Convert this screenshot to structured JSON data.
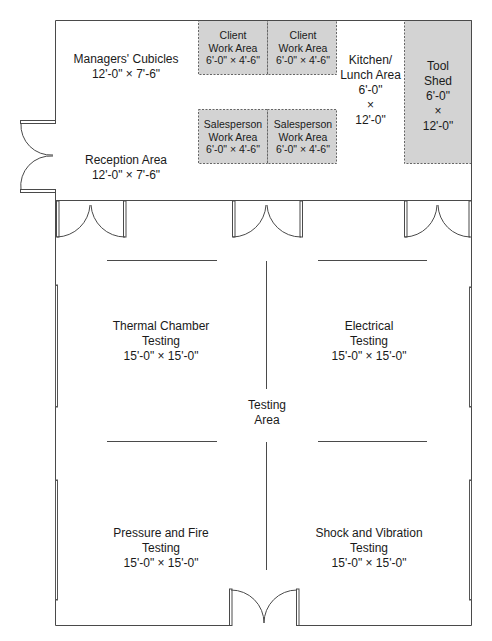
{
  "colors": {
    "wall": "#555555",
    "shaded_area": "#d3d3d3",
    "dashed_border": "#666666",
    "background": "#ffffff"
  },
  "rooms": {
    "managers_cubicles": {
      "name": "Managers' Cubicles",
      "size": "12'-0\" × 7'-6\""
    },
    "reception_area": {
      "name": "Reception Area",
      "size": "12'-0\" × 7'-6\""
    },
    "client_work_area_1": {
      "line1": "Client",
      "line2": "Work Area",
      "size": "6'-0\" × 4'-6\""
    },
    "client_work_area_2": {
      "line1": "Client",
      "line2": "Work Area",
      "size": "6'-0\" × 4'-6\""
    },
    "salesperson_work_area_1": {
      "line1": "Salesperson",
      "line2": "Work Area",
      "size": "6'-0\" × 4'-6\""
    },
    "salesperson_work_area_2": {
      "line1": "Salesperson",
      "line2": "Work Area",
      "size": "6'-0\" × 4'-6\""
    },
    "kitchen": {
      "line1": "Kitchen/",
      "line2": "Lunch Area",
      "dim1": "6'-0\"",
      "times": "×",
      "dim2": "12'-0\""
    },
    "tool_shed": {
      "line1": "Tool",
      "line2": "Shed",
      "dim1": "6'-0\"",
      "times": "×",
      "dim2": "12'-0\""
    },
    "thermal_chamber": {
      "line1": "Thermal Chamber",
      "line2": "Testing",
      "size": "15'-0\" × 15'-0\""
    },
    "electrical": {
      "line1": "Electrical",
      "line2": "Testing",
      "size": "15'-0\" × 15'-0\""
    },
    "testing_area": {
      "line1": "Testing",
      "line2": "Area"
    },
    "pressure_fire": {
      "line1": "Pressure and Fire",
      "line2": "Testing",
      "size": "15'-0\" × 15'-0\""
    },
    "shock_vibration": {
      "line1": "Shock and Vibration",
      "line2": "Testing",
      "size": "15'-0\" × 15'-0\""
    }
  }
}
